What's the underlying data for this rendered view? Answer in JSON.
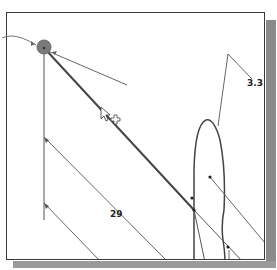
{
  "drawing": {
    "title": "CAD sketch viewport",
    "dimensions": [
      {
        "id": "dim-3-3",
        "label": "3.3",
        "x": 247,
        "y": 79
      },
      {
        "id": "dim-29",
        "label": "29",
        "x": 110,
        "y": 210
      }
    ],
    "cursor": {
      "type": "pointer-with-snap-cross",
      "x": 101,
      "y": 109
    }
  },
  "colors": {
    "line": "#555555",
    "thick_line": "#444444",
    "node_fill": "#7a7a7a",
    "frame_border": "#3a3a3a",
    "shadow": "#8a8a8a"
  }
}
